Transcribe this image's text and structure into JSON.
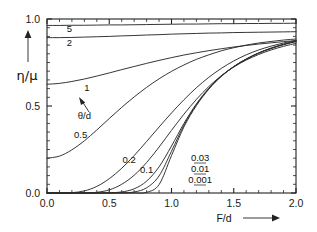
{
  "chart_data": {
    "type": "line",
    "title": "",
    "xlabel": "F/d",
    "ylabel": "η/μ",
    "xlim": [
      0.0,
      2.0
    ],
    "ylim": [
      0.0,
      1.0
    ],
    "grid": false,
    "legend_position": "inline-curve-labels",
    "legend_title": "θ/d",
    "x_ticks": [
      "0.0",
      "0.5",
      "1.0",
      "1.5",
      "2.0"
    ],
    "x_tick_values": [
      0.0,
      0.5,
      1.0,
      1.5,
      2.0
    ],
    "x_minor_step": 0.1,
    "y_ticks": [
      "0.0",
      "0.5",
      "1.0"
    ],
    "y_tick_values": [
      0.0,
      0.5,
      1.0
    ],
    "y_minor_step": 0.05,
    "x": [
      0.0,
      0.1,
      0.2,
      0.3,
      0.4,
      0.5,
      0.6,
      0.7,
      0.8,
      0.9,
      1.0,
      1.1,
      1.2,
      1.3,
      1.4,
      1.5,
      1.6,
      1.7,
      1.8,
      1.9,
      2.0
    ],
    "series": [
      {
        "name": "5",
        "label": "5",
        "values": [
          0.963,
          0.963,
          0.964,
          0.964,
          0.965,
          0.966,
          0.966,
          0.967,
          0.968,
          0.969,
          0.97,
          0.971,
          0.971,
          0.972,
          0.973,
          0.973,
          0.974,
          0.974,
          0.975,
          0.975,
          0.976
        ]
      },
      {
        "name": "2",
        "label": "2",
        "values": [
          0.893,
          0.893,
          0.894,
          0.896,
          0.898,
          0.9,
          0.903,
          0.905,
          0.908,
          0.91,
          0.913,
          0.915,
          0.917,
          0.919,
          0.92,
          0.922,
          0.923,
          0.924,
          0.925,
          0.926,
          0.927
        ]
      },
      {
        "name": "1",
        "label": "1",
        "values": [
          0.625,
          0.63,
          0.641,
          0.655,
          0.672,
          0.69,
          0.709,
          0.727,
          0.745,
          0.762,
          0.778,
          0.793,
          0.806,
          0.818,
          0.829,
          0.839,
          0.848,
          0.856,
          0.863,
          0.87,
          0.876
        ]
      },
      {
        "name": "0.5",
        "label": "0.5",
        "values": [
          0.2,
          0.212,
          0.248,
          0.3,
          0.362,
          0.428,
          0.492,
          0.552,
          0.607,
          0.656,
          0.699,
          0.736,
          0.768,
          0.794,
          0.817,
          0.835,
          0.85,
          0.862,
          0.871,
          0.879,
          0.885
        ]
      },
      {
        "name": "0.2",
        "label": "0.2",
        "values": [
          0.0,
          0.0,
          0.002,
          0.012,
          0.038,
          0.082,
          0.142,
          0.215,
          0.296,
          0.379,
          0.46,
          0.536,
          0.605,
          0.665,
          0.716,
          0.759,
          0.794,
          0.822,
          0.844,
          0.862,
          0.876
        ]
      },
      {
        "name": "0.1",
        "label": "0.1",
        "values": [
          0.0,
          0.0,
          0.0,
          0.0,
          0.004,
          0.018,
          0.05,
          0.102,
          0.175,
          0.264,
          0.36,
          0.453,
          0.538,
          0.612,
          0.674,
          0.724,
          0.764,
          0.796,
          0.822,
          0.843,
          0.86
        ]
      },
      {
        "name": "0.03",
        "label": "0.03",
        "values": [
          0.0,
          0.0,
          0.0,
          0.0,
          0.0,
          0.001,
          0.006,
          0.024,
          0.068,
          0.15,
          0.27,
          0.4,
          0.512,
          0.602,
          0.672,
          0.726,
          0.769,
          0.803,
          0.83,
          0.852,
          0.87
        ]
      },
      {
        "name": "0.01",
        "label": "0.01",
        "values": [
          0.0,
          0.0,
          0.0,
          0.0,
          0.0,
          0.0,
          0.001,
          0.006,
          0.03,
          0.098,
          0.24,
          0.39,
          0.508,
          0.6,
          0.672,
          0.727,
          0.77,
          0.805,
          0.832,
          0.854,
          0.872
        ]
      },
      {
        "name": "0.001",
        "label": "0.001",
        "values": [
          0.0,
          0.0,
          0.0,
          0.0,
          0.0,
          0.0,
          0.0,
          0.0,
          0.004,
          0.048,
          0.215,
          0.38,
          0.502,
          0.597,
          0.67,
          0.726,
          0.77,
          0.805,
          0.833,
          0.855,
          0.873
        ]
      }
    ],
    "annotations": [
      {
        "text": "θ/d",
        "kind": "parameter-legend-title",
        "x": 0.3,
        "y": 0.425
      },
      {
        "text": "5",
        "kind": "curve-label",
        "x": 0.18,
        "y": 0.925
      },
      {
        "text": "2",
        "kind": "curve-label",
        "x": 0.18,
        "y": 0.845
      },
      {
        "text": "1",
        "kind": "curve-label",
        "x": 0.32,
        "y": 0.585
      },
      {
        "text": "0.5",
        "kind": "curve-label",
        "x": 0.27,
        "y": 0.315
      },
      {
        "text": "0.2",
        "kind": "curve-label",
        "x": 0.66,
        "y": 0.175
      },
      {
        "text": "0.1",
        "kind": "curve-label",
        "x": 0.8,
        "y": 0.115
      },
      {
        "text": "0.03",
        "kind": "curve-label",
        "x": 1.23,
        "y": 0.185
      },
      {
        "text": "0.01",
        "kind": "curve-label",
        "x": 1.23,
        "y": 0.12
      },
      {
        "text": "0.001",
        "kind": "curve-label",
        "x": 1.23,
        "y": 0.055
      }
    ]
  },
  "axes": {
    "x_title": "F/d",
    "y_title": "η/μ",
    "x_arrow": "right-arrow-icon",
    "y_arrow": "up-arrow-icon"
  }
}
